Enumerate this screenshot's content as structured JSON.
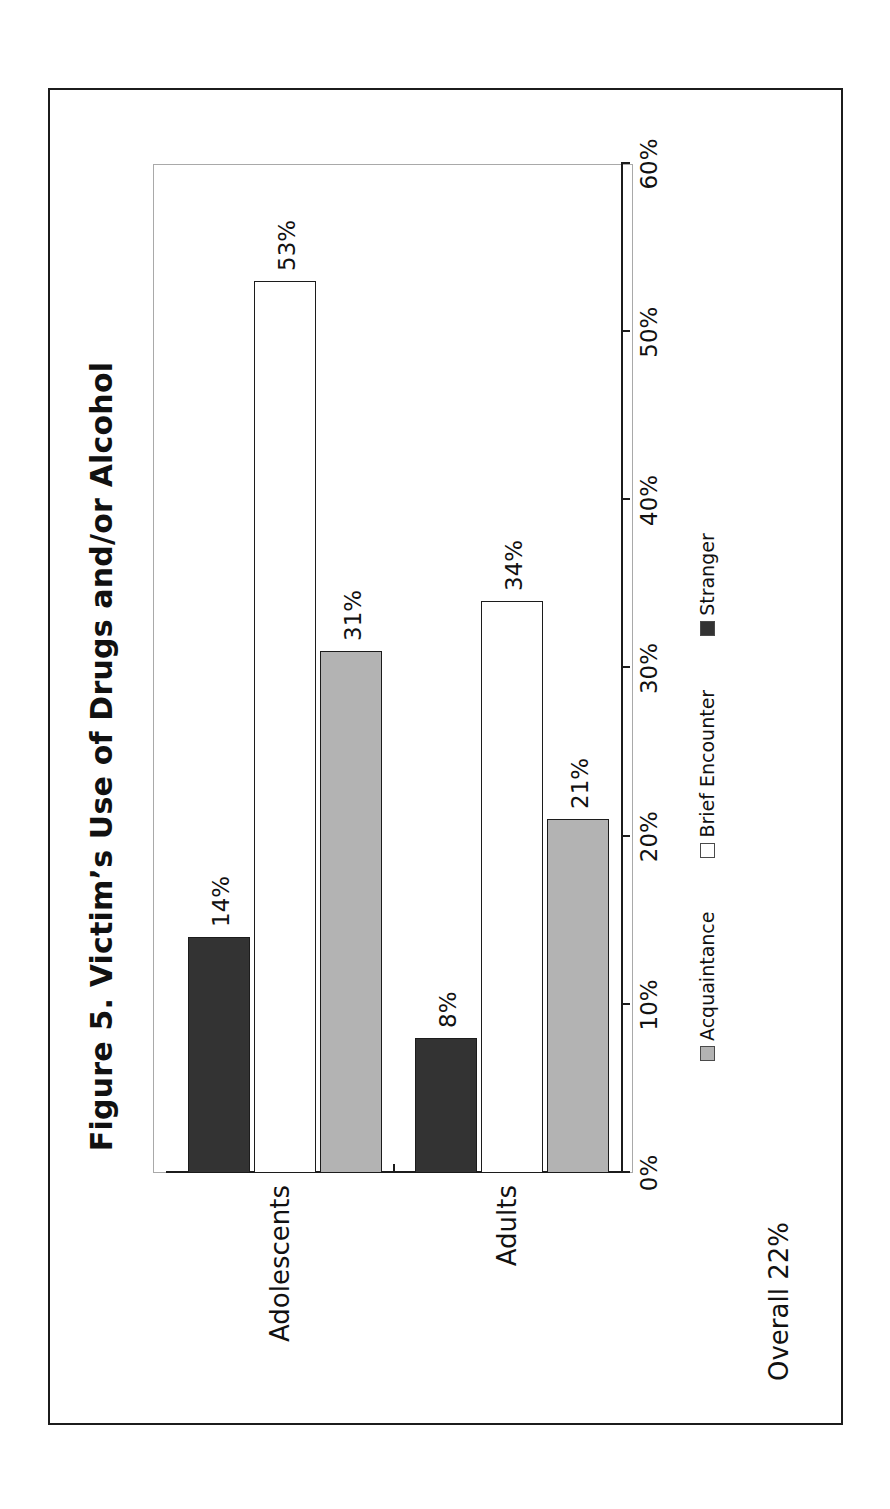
{
  "figure": {
    "title": "Figure 5. Victim’s Use of Drugs and/or Alcohol",
    "footnote": "Overall 22%"
  },
  "legend": {
    "position": "bottom",
    "items": [
      {
        "label": "Acquaintance",
        "key": "acquaintance",
        "color": "#b3b3b3"
      },
      {
        "label": "Brief Encounter",
        "key": "brief-encounter",
        "color": "#ffffff"
      },
      {
        "label": "Stranger",
        "key": "stranger",
        "color": "#333333"
      }
    ]
  },
  "axis": {
    "tick_labels": [
      "0%",
      "10%",
      "20%",
      "30%",
      "40%",
      "50%",
      "60%"
    ],
    "categories": [
      "Adolescents",
      "Adults"
    ]
  },
  "bar_labels": {
    "adolescents_stranger": "14%",
    "adolescents_brief_encounter": "53%",
    "adolescents_acquaintance": "31%",
    "adults_stranger": "8%",
    "adults_brief_encounter": "34%",
    "adults_acquaintance": "21%"
  },
  "chart_data": {
    "type": "bar",
    "orientation": "horizontal",
    "title": "Figure 5. Victim’s Use of Drugs and/or Alcohol",
    "xlabel": "",
    "ylabel": "",
    "categories": [
      "Adolescents",
      "Adults"
    ],
    "series": [
      {
        "name": "Stranger",
        "values": [
          14,
          8
        ],
        "color": "#333333",
        "labels": [
          "14%",
          "8%"
        ]
      },
      {
        "name": "Brief Encounter",
        "values": [
          53,
          34
        ],
        "color": "#ffffff",
        "labels": [
          "53%",
          "34%"
        ]
      },
      {
        "name": "Acquaintance",
        "values": [
          31,
          21
        ],
        "color": "#b3b3b3",
        "labels": [
          "31%",
          "21%"
        ]
      }
    ],
    "xlim": [
      0,
      60
    ],
    "xticks": [
      0,
      10,
      20,
      30,
      40,
      50,
      60
    ],
    "xtick_labels": [
      "0%",
      "10%",
      "20%",
      "30%",
      "40%",
      "50%",
      "60%"
    ],
    "value_unit": "percent",
    "grid": false,
    "legend_position": "bottom",
    "annotations": [
      "Overall 22%"
    ]
  }
}
